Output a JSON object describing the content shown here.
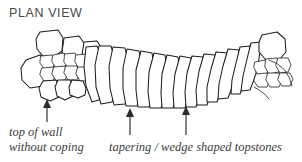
{
  "figure": {
    "title": "PLAN VIEW",
    "type": "hand-drawn-technical-illustration",
    "background_color": "#ffffff",
    "ink_color": "#1d1d1d",
    "title_color": "#4a4a4a"
  },
  "annotations": {
    "left": {
      "line1": "top of wall",
      "line2": "without coping"
    },
    "right": {
      "text": "tapering / wedge shaped topstones"
    }
  },
  "arrows": [
    {
      "name": "arrow-top-of-wall",
      "x": 47,
      "y_top": 100,
      "y_bottom": 122
    },
    {
      "name": "arrow-tapering-left",
      "x": 130,
      "y_top": 108,
      "y_bottom": 135
    },
    {
      "name": "arrow-tapering-right",
      "x": 186,
      "y_top": 106,
      "y_bottom": 135
    }
  ]
}
